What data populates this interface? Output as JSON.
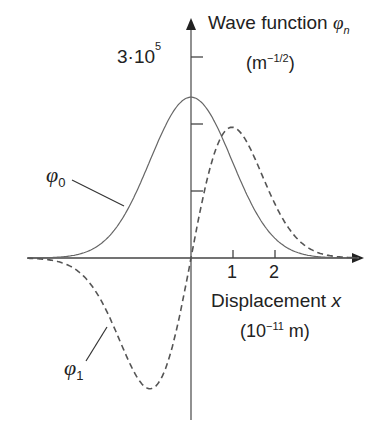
{
  "chart_data": {
    "type": "line",
    "title": "",
    "ylabel": "Wave function φ_n",
    "ylabel_unit": "(m^-1/2)",
    "xlabel": "Displacement x",
    "xlabel_unit": "(10^-11 m)",
    "y_tick_labels": [
      "3·10^5"
    ],
    "y_ticks": [
      100000,
      200000,
      300000
    ],
    "x_tick_labels": [
      "1",
      "2"
    ],
    "x_ticks": [
      1,
      2
    ],
    "xlim": [
      -3.1,
      3.1
    ],
    "ylim": [
      -240000.0,
      330000.0
    ],
    "grid": false,
    "legend": "inline annotations",
    "series": [
      {
        "name": "φ0",
        "style": "solid",
        "x": [
          -3,
          -2,
          -1.5,
          -1,
          -0.5,
          0,
          0.5,
          1,
          1.5,
          2,
          3
        ],
        "values": [
          0,
          16000,
          54000,
          127000,
          205000,
          240000,
          205000,
          127000,
          54000,
          16000,
          0
        ]
      },
      {
        "name": "φ1",
        "style": "dashed",
        "x": [
          -3,
          -2,
          -1.5,
          -1,
          -0.5,
          0,
          0.5,
          1,
          1.5,
          2,
          3
        ],
        "values": [
          0,
          -48000,
          -115000,
          -190000,
          -150000,
          0,
          150000,
          190000,
          115000,
          48000,
          0
        ]
      }
    ],
    "annotations": [
      "φ0",
      "φ1"
    ]
  },
  "labels": {
    "y_title": "Wave function ",
    "y_title_sym": "φ",
    "y_title_sub": "n",
    "y_unit_pre": "(m",
    "y_unit_sup": "−1/2",
    "y_unit_post": ")",
    "y_tick_base": "3·10",
    "y_tick_exp": "5",
    "x_title": "Displacement ",
    "x_title_sym": "x",
    "x_unit_pre": "(10",
    "x_unit_sup": "−11",
    "x_unit_post": " m)",
    "tick1": "1",
    "tick2": "2",
    "phi0_sym": "φ",
    "phi0_sub": "0",
    "phi1_sym": "φ",
    "phi1_sub": "1"
  }
}
